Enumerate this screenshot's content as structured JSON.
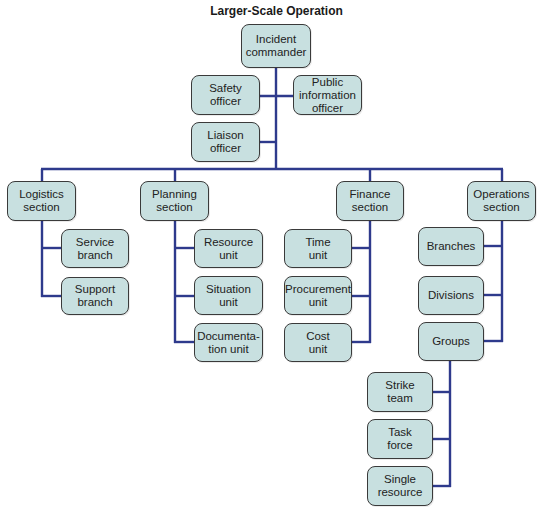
{
  "title": "Larger-Scale Operation",
  "colors": {
    "box_fill": "#c8e0e0",
    "box_border": "#3a3a3a",
    "connector": "#2e3a8c"
  },
  "command_staff": {
    "incident_commander": "Incident\ncommander",
    "safety_officer": "Safety\nofficer",
    "public_information_officer": "Public\ninformation\nofficer",
    "liaison_officer": "Liaison\nofficer"
  },
  "sections": {
    "logistics": {
      "label": "Logistics\nsection",
      "children": [
        "Service\nbranch",
        "Support\nbranch"
      ]
    },
    "planning": {
      "label": "Planning\nsection",
      "children": [
        "Resource\nunit",
        "Situation\nunit",
        "Documenta-\ntion unit"
      ]
    },
    "finance": {
      "label": "Finance\nsection",
      "children": [
        "Time\nunit",
        "Procurement\nunit",
        "Cost\nunit"
      ]
    },
    "operations": {
      "label": "Operations\nsection",
      "children": [
        "Branches",
        "Divisions",
        "Groups"
      ]
    }
  },
  "groups_children": [
    "Strike\nteam",
    "Task\nforce",
    "Single\nresource"
  ]
}
